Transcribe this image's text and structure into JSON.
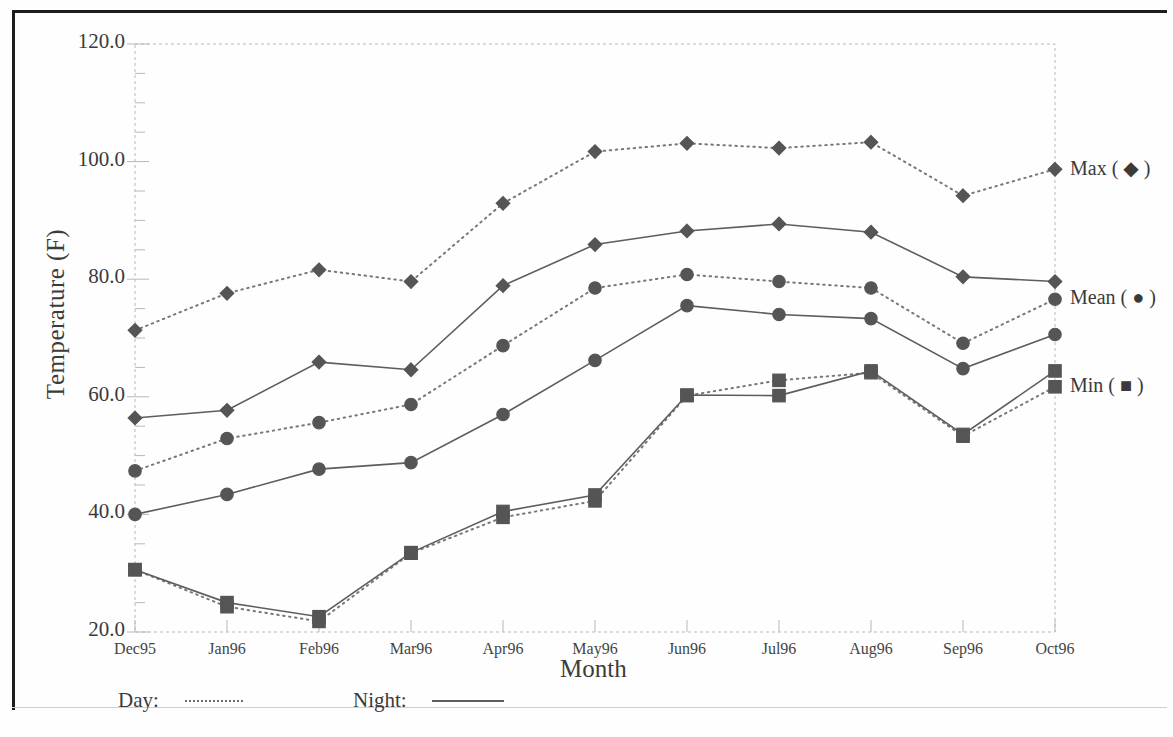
{
  "chart_data": {
    "type": "line",
    "title": "",
    "xlabel": "Month",
    "ylabel": "Temperature (F)",
    "ylim": [
      20.0,
      120.0
    ],
    "ytick_step": 20.0,
    "ytick_labels": [
      "120.0",
      "100.0",
      "80.0",
      "60.0",
      "40.0",
      "20.0"
    ],
    "ytick_values": [
      120.0,
      100.0,
      80.0,
      60.0,
      40.0,
      20.0
    ],
    "minor_ticks": true,
    "grid": false,
    "legend_position": "right-inside and below-axis",
    "categories": [
      "Dec95",
      "Jan96",
      "Feb96",
      "Mar96",
      "Apr96",
      "May96",
      "Jun96",
      "Jul96",
      "Aug96",
      "Sep96",
      "Oct96"
    ],
    "series": [
      {
        "name": "Day Max",
        "label": "Max ( ◆ )",
        "marker": "diamond",
        "line": "dotted",
        "group": "Day",
        "values": [
          71.3,
          77.6,
          81.6,
          79.6,
          92.9,
          101.7,
          103.1,
          102.3,
          103.3,
          94.2,
          98.7
        ]
      },
      {
        "name": "Night Max",
        "label": "Max ( ◆ )",
        "marker": "diamond",
        "line": "solid",
        "group": "Night",
        "values": [
          56.4,
          57.7,
          65.9,
          64.6,
          78.9,
          85.9,
          88.2,
          89.4,
          88.0,
          80.4,
          79.6
        ]
      },
      {
        "name": "Day Mean",
        "label": "Mean ( ● )",
        "marker": "circle",
        "line": "dotted",
        "group": "Day",
        "values": [
          47.4,
          52.9,
          55.6,
          58.7,
          68.7,
          78.5,
          80.8,
          79.6,
          78.5,
          69.1,
          76.6
        ]
      },
      {
        "name": "Night Mean",
        "label": "Mean ( ● )",
        "marker": "circle",
        "line": "solid",
        "group": "Night",
        "values": [
          40.0,
          43.4,
          47.7,
          48.8,
          57.0,
          66.2,
          75.5,
          74.0,
          73.3,
          64.8,
          70.6
        ]
      },
      {
        "name": "Day Min",
        "label": "Min ( ■ )",
        "marker": "square",
        "line": "dotted",
        "group": "Day",
        "values": [
          30.6,
          24.3,
          21.8,
          33.4,
          39.5,
          42.3,
          60.2,
          62.8,
          64.1,
          53.3,
          61.7
        ]
      },
      {
        "name": "Night Min",
        "label": "Min ( ■ )",
        "marker": "square",
        "line": "solid",
        "group": "Night",
        "values": [
          30.6,
          25.0,
          22.6,
          33.5,
          40.5,
          43.3,
          60.3,
          60.2,
          64.4,
          53.6,
          64.4
        ]
      }
    ],
    "right_legend": [
      {
        "label": "Max ( ◆ )",
        "value": 98.7
      },
      {
        "label": "Mean ( ● )",
        "value": 76.6
      },
      {
        "label": "Min ( ■ )",
        "value": 61.7
      }
    ],
    "bottom_legend": [
      {
        "label": "Day:",
        "line": "dotted"
      },
      {
        "label": "Night:",
        "line": "solid"
      }
    ],
    "colors": {
      "marker": "#555555",
      "day_line": "#787878",
      "night_line": "#5d5d5d",
      "axis": "#b8b8b8",
      "text": "#3a3a3a"
    }
  }
}
